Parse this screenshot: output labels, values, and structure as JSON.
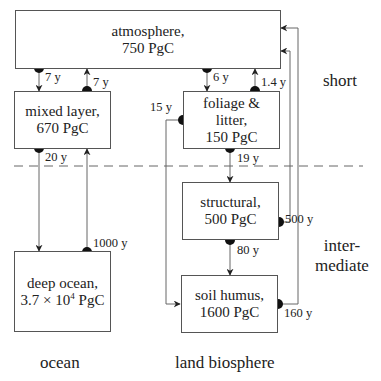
{
  "reservoirs": {
    "atmosphere": {
      "name": "atmosphere,",
      "amount": "750 PgC"
    },
    "mixed_layer": {
      "name": "mixed layer,",
      "amount": "670 PgC"
    },
    "foliage": {
      "name": "foliage &",
      "name2": "litter,",
      "amount": "150 PgC"
    },
    "structural": {
      "name": "structural,",
      "amount": "500 PgC"
    },
    "deep_ocean": {
      "name": "deep ocean,",
      "amount_prefix": "3.7 × 10",
      "amount_exp": "4",
      "amount_suffix": " PgC"
    },
    "soil_humus": {
      "name": "soil humus,",
      "amount": "1600 PgC"
    }
  },
  "fluxes": {
    "atm_to_mixed": "7 y",
    "mixed_to_atm": "7 y",
    "atm_to_foliage": "6 y",
    "foliage_to_atm": "1.4 y",
    "foliage_to_soil": "15 y",
    "mixed_to_deep": "20 y",
    "deep_to_mixed": "1000 y",
    "foliage_to_structural": "19 y",
    "structural_to_atm": "500 y",
    "structural_to_soil": "80 y",
    "soil_to_atm": "160 y"
  },
  "timescales": {
    "short": "short",
    "intermediate_1": "inter-",
    "intermediate_2": "mediate"
  },
  "columns": {
    "ocean": "ocean",
    "land": "land biosphere"
  },
  "colors": {
    "line": "#555555",
    "dot": "#111111",
    "text": "#222222"
  }
}
